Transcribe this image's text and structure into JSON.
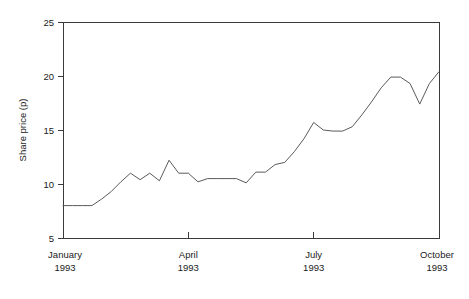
{
  "chart_data": {
    "type": "line",
    "title": "",
    "xlabel": "",
    "ylabel": "Share price (p)",
    "ylim": [
      5,
      25
    ],
    "yticks": [
      5,
      10,
      15,
      20,
      25
    ],
    "ytick_labels": [
      "5",
      "10",
      "15",
      "20",
      "25"
    ],
    "xlim": [
      0,
      39
    ],
    "xticks": [
      0,
      13,
      26,
      39
    ],
    "xtick_labels": [
      "January\n1993",
      "April\n1993",
      "July\n1993",
      "October\n1993"
    ],
    "xtick_months": [
      "January",
      "April",
      "July",
      "October"
    ],
    "xtick_years": [
      "1993",
      "1993",
      "1993",
      "1993"
    ],
    "grid": false,
    "legend": null,
    "legend_position": "none",
    "series": [
      {
        "name": "Share price",
        "x": [
          0,
          1,
          2,
          3,
          4,
          5,
          6,
          7,
          8,
          9,
          10,
          11,
          12,
          13,
          14,
          15,
          16,
          17,
          18,
          19,
          20,
          21,
          22,
          23,
          24,
          25,
          26,
          27,
          28,
          29,
          30,
          31,
          32,
          33,
          34,
          35,
          36,
          37,
          38,
          39
        ],
        "values": [
          8.0,
          8.0,
          8.0,
          8.0,
          8.6,
          9.3,
          10.2,
          11.0,
          10.4,
          11.0,
          10.3,
          12.2,
          11.0,
          11.0,
          10.2,
          10.5,
          10.5,
          10.5,
          10.5,
          10.1,
          11.1,
          11.1,
          11.8,
          12.0,
          13.0,
          14.2,
          15.7,
          15.0,
          14.9,
          14.9,
          15.3,
          16.4,
          17.6,
          18.9,
          19.9,
          19.9,
          19.3,
          17.4,
          19.3,
          20.4
        ]
      }
    ],
    "line_color": "#5a5a5a",
    "axis_color": "#3a3a3a",
    "background_color": "#ffffff"
  },
  "axes": {
    "y_title": "Share price (p)"
  }
}
